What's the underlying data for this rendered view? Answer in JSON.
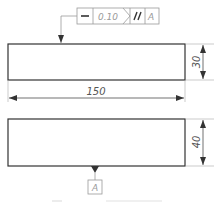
{
  "feature_control_frame": {
    "symbol": "straightness",
    "symbol_glyph": "—",
    "tolerance": "0.10",
    "modifier_glyph": "//",
    "modifier": "parallelism",
    "datum": "A"
  },
  "top_part": {
    "width_dimension": "150",
    "height_dimension": "30"
  },
  "bottom_part": {
    "height_dimension": "40",
    "datum_label": "A"
  },
  "colors": {
    "outline": "#333333",
    "dimension": "#555555",
    "frame": "#9a9a9a"
  }
}
